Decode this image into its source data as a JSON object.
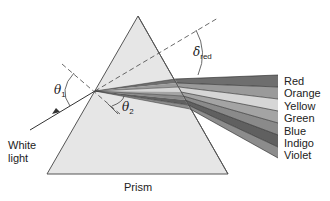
{
  "figure": {
    "labels": {
      "incident_light": [
        "White",
        "light"
      ],
      "prism": "Prism",
      "theta1": "θ",
      "theta1_sub": "1",
      "theta2": "θ",
      "theta2_sub": "2",
      "delta": "δ",
      "delta_sub": "red"
    },
    "spectrum": [
      {
        "name": "Red",
        "shade": "#6e6e6e"
      },
      {
        "name": "Orange",
        "shade": "#9a9a9a"
      },
      {
        "name": "Yellow",
        "shade": "#d6d6d6"
      },
      {
        "name": "Green",
        "shade": "#a4a4a4"
      },
      {
        "name": "Blue",
        "shade": "#8a8a8a"
      },
      {
        "name": "Indigo",
        "shade": "#606060"
      },
      {
        "name": "Violet",
        "shade": "#8c8c8c"
      }
    ],
    "colors": {
      "prism_fill": "#e6e6e6",
      "prism_edge": "#555555",
      "line": "#333333"
    }
  }
}
